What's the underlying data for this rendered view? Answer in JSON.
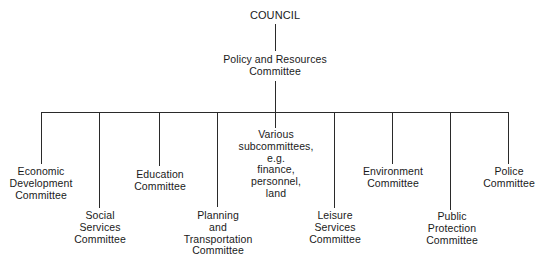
{
  "diagram": {
    "type": "organization-chart",
    "root": {
      "label": [
        "COUNCIL"
      ]
    },
    "second_level": {
      "label": [
        "Policy and Resources",
        "Committee"
      ]
    },
    "committees": [
      {
        "id": "economic",
        "label": [
          "Economic",
          "Development",
          "Committee"
        ]
      },
      {
        "id": "social",
        "label": [
          "Social",
          "Services",
          "Committee"
        ]
      },
      {
        "id": "education",
        "label": [
          "Education",
          "Committee"
        ]
      },
      {
        "id": "planning",
        "label": [
          "Planning",
          "and",
          "Transportation",
          "Committee"
        ]
      },
      {
        "id": "various",
        "label": [
          "Various",
          "subcommittees,",
          "e.g.",
          "finance,",
          "personnel,",
          "land"
        ]
      },
      {
        "id": "leisure",
        "label": [
          "Leisure",
          "Services",
          "Committee"
        ]
      },
      {
        "id": "environment",
        "label": [
          "Environment",
          "Committee"
        ]
      },
      {
        "id": "public-protection",
        "label": [
          "Public",
          "Protection",
          "Committee"
        ]
      },
      {
        "id": "police",
        "label": [
          "Police",
          "Committee"
        ]
      }
    ]
  }
}
